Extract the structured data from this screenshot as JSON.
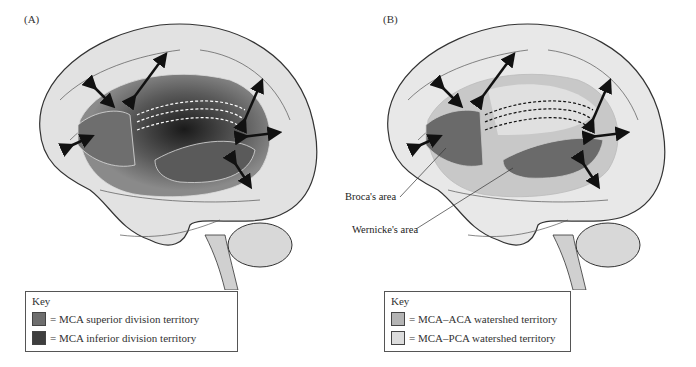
{
  "figure": {
    "panels": [
      {
        "label": "(A)",
        "key": {
          "title": "Key",
          "items": [
            {
              "label": "= MCA superior division territory",
              "color": "#6e6e6e"
            },
            {
              "label": "= MCA inferior division territory",
              "color": "#3e3e3e"
            }
          ]
        }
      },
      {
        "label": "(B)",
        "annotations": [
          "Broca's area",
          "Wernicke's area"
        ],
        "key": {
          "title": "Key",
          "items": [
            {
              "label": "= MCA–ACA watershed territory",
              "color": "#b4b4b4"
            },
            {
              "label": "= MCA–PCA watershed territory",
              "color": "#dcdcdc"
            }
          ]
        }
      }
    ]
  }
}
